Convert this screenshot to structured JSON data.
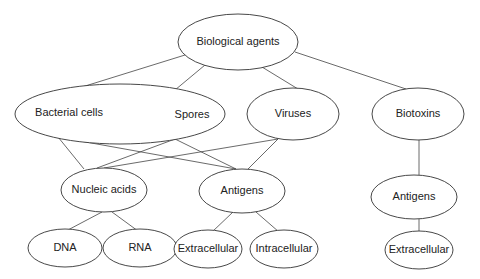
{
  "diagram": {
    "type": "hierarchy",
    "nodes": {
      "root": {
        "label": "Biological agents"
      },
      "bacterial": {
        "label": "Bacterial cells"
      },
      "spores": {
        "label": "Spores"
      },
      "viruses": {
        "label": "Viruses"
      },
      "biotoxins": {
        "label": "Biotoxins"
      },
      "nucleic_acids": {
        "label": "Nucleic acids"
      },
      "antigens_mid": {
        "label": "Antigens"
      },
      "antigens_right": {
        "label": "Antigens"
      },
      "dna": {
        "label": "DNA"
      },
      "rna": {
        "label": "RNA"
      },
      "extracellular_mid": {
        "label": "Extracellular"
      },
      "intracellular_mid": {
        "label": "Intracellular"
      },
      "extracellular_right": {
        "label": "Extracellular"
      }
    },
    "edges": [
      [
        "root",
        "bacterial"
      ],
      [
        "root",
        "spores"
      ],
      [
        "root",
        "viruses"
      ],
      [
        "root",
        "biotoxins"
      ],
      [
        "bacterial",
        "nucleic_acids"
      ],
      [
        "bacterial",
        "antigens_mid"
      ],
      [
        "spores",
        "nucleic_acids"
      ],
      [
        "spores",
        "antigens_mid"
      ],
      [
        "viruses",
        "nucleic_acids"
      ],
      [
        "viruses",
        "antigens_mid"
      ],
      [
        "biotoxins",
        "antigens_right"
      ],
      [
        "nucleic_acids",
        "dna"
      ],
      [
        "nucleic_acids",
        "rna"
      ],
      [
        "antigens_mid",
        "extracellular_mid"
      ],
      [
        "antigens_mid",
        "intracellular_mid"
      ],
      [
        "antigens_right",
        "extracellular_right"
      ]
    ]
  }
}
